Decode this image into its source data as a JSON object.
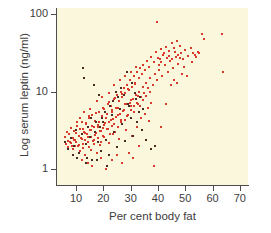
{
  "chart_data": {
    "type": "scatter",
    "title": "",
    "xlabel": "Per cent body fat",
    "ylabel": "Log serum leptin (ng/ml)",
    "xlim": [
      3,
      73
    ],
    "ylim": [
      0.62,
      120
    ],
    "yscale": "log",
    "xscale": "linear",
    "grid": false,
    "legend": null,
    "xticks": [
      10,
      20,
      30,
      40,
      50,
      60,
      70
    ],
    "xtick_labels": [
      "10",
      "20",
      "30",
      "40",
      "50",
      "60",
      "70"
    ],
    "yticks": [
      1,
      10,
      100
    ],
    "ytick_labels": [
      "1",
      "10",
      "100"
    ],
    "panel_background": "#fbf7dc",
    "axis_color": "#4c4c4c",
    "series": [
      {
        "name": "primary",
        "marker_color": "#d83a2e",
        "points": [
          [
            5.8,
            2.6
          ],
          [
            6.2,
            2.1
          ],
          [
            6.5,
            3.0
          ],
          [
            6.9,
            2.3
          ],
          [
            7.2,
            1.9
          ],
          [
            7.5,
            2.8
          ],
          [
            7.8,
            2.2
          ],
          [
            8.1,
            3.4
          ],
          [
            8.4,
            2.0
          ],
          [
            8.7,
            2.5
          ],
          [
            9.0,
            1.8
          ],
          [
            9.2,
            3.1
          ],
          [
            9.5,
            2.4
          ],
          [
            9.8,
            2.9
          ],
          [
            10.1,
            2.2
          ],
          [
            10.4,
            3.6
          ],
          [
            10.7,
            2.0
          ],
          [
            11.0,
            2.7
          ],
          [
            11.3,
            1.7
          ],
          [
            11.6,
            3.3
          ],
          [
            11.9,
            2.5
          ],
          [
            12.2,
            4.0
          ],
          [
            12.5,
            2.1
          ],
          [
            12.8,
            3.0
          ],
          [
            13.1,
            2.4
          ],
          [
            13.4,
            1.5
          ],
          [
            13.7,
            3.8
          ],
          [
            14.0,
            2.8
          ],
          [
            14.3,
            2.2
          ],
          [
            14.6,
            4.5
          ],
          [
            14.9,
            1.9
          ],
          [
            15.2,
            3.2
          ],
          [
            15.5,
            2.6
          ],
          [
            15.8,
            5.0
          ],
          [
            16.1,
            2.3
          ],
          [
            16.4,
            3.5
          ],
          [
            16.7,
            2.1
          ],
          [
            17.0,
            4.2
          ],
          [
            17.3,
            2.9
          ],
          [
            17.6,
            1.6
          ],
          [
            17.9,
            3.7
          ],
          [
            18.2,
            2.5
          ],
          [
            18.5,
            5.5
          ],
          [
            18.8,
            3.1
          ],
          [
            19.1,
            2.2
          ],
          [
            19.4,
            4.8
          ],
          [
            19.7,
            3.4
          ],
          [
            20.0,
            2.7
          ],
          [
            20.3,
            6.0
          ],
          [
            20.6,
            3.9
          ],
          [
            20.9,
            2.4
          ],
          [
            21.2,
            5.2
          ],
          [
            21.5,
            3.3
          ],
          [
            21.8,
            7.0
          ],
          [
            22.1,
            4.1
          ],
          [
            22.4,
            2.8
          ],
          [
            22.7,
            6.5
          ],
          [
            23.0,
            3.6
          ],
          [
            23.3,
            5.8
          ],
          [
            23.6,
            4.4
          ],
          [
            23.9,
            8.0
          ],
          [
            24.2,
            3.0
          ],
          [
            24.5,
            6.2
          ],
          [
            24.8,
            4.7
          ],
          [
            25.1,
            9.0
          ],
          [
            25.4,
            3.5
          ],
          [
            25.7,
            7.5
          ],
          [
            26.0,
            5.1
          ],
          [
            26.3,
            10.0
          ],
          [
            26.6,
            4.0
          ],
          [
            26.9,
            8.5
          ],
          [
            27.2,
            5.6
          ],
          [
            27.5,
            11.0
          ],
          [
            27.8,
            4.3
          ],
          [
            28.1,
            9.5
          ],
          [
            28.4,
            6.8
          ],
          [
            28.7,
            12.0
          ],
          [
            29.0,
            5.0
          ],
          [
            29.3,
            10.5
          ],
          [
            29.6,
            7.2
          ],
          [
            29.9,
            14.0
          ],
          [
            30.2,
            5.8
          ],
          [
            30.5,
            11.5
          ],
          [
            30.8,
            8.0
          ],
          [
            31.1,
            16.0
          ],
          [
            31.4,
            6.5
          ],
          [
            31.7,
            13.0
          ],
          [
            32.0,
            9.0
          ],
          [
            32.3,
            18.0
          ],
          [
            32.6,
            7.0
          ],
          [
            32.9,
            15.0
          ],
          [
            33.2,
            10.0
          ],
          [
            33.5,
            20.0
          ],
          [
            33.8,
            8.5
          ],
          [
            34.1,
            17.0
          ],
          [
            34.4,
            11.5
          ],
          [
            34.7,
            22.0
          ],
          [
            35.0,
            9.5
          ],
          [
            35.3,
            19.0
          ],
          [
            35.6,
            13.0
          ],
          [
            36.0,
            25.0
          ],
          [
            36.4,
            11.0
          ],
          [
            36.8,
            21.0
          ],
          [
            37.2,
            15.0
          ],
          [
            37.6,
            28.0
          ],
          [
            38.0,
            12.0
          ],
          [
            38.4,
            24.0
          ],
          [
            38.8,
            17.0
          ],
          [
            39.2,
            32.0
          ],
          [
            39.6,
            14.0
          ],
          [
            40.0,
            27.0
          ],
          [
            40.5,
            19.0
          ],
          [
            41.0,
            35.0
          ],
          [
            41.5,
            16.0
          ],
          [
            42.0,
            30.0
          ],
          [
            42.5,
            22.0
          ],
          [
            43.0,
            38.0
          ],
          [
            43.5,
            18.0
          ],
          [
            44.0,
            33.0
          ],
          [
            44.5,
            25.0
          ],
          [
            45.0,
            42.0
          ],
          [
            45.5,
            20.0
          ],
          [
            46.0,
            36.0
          ],
          [
            46.5,
            28.0
          ],
          [
            47.0,
            45.0
          ],
          [
            47.5,
            23.0
          ],
          [
            48.0,
            39.0
          ],
          [
            48.5,
            31.0
          ],
          [
            49.0,
            26.0
          ],
          [
            50.0,
            34.0
          ],
          [
            51.0,
            29.0
          ],
          [
            52.0,
            37.0
          ],
          [
            53.0,
            31.0
          ],
          [
            54.0,
            28.0
          ],
          [
            56.0,
            55.0
          ],
          [
            57.0,
            48.0
          ],
          [
            63.5,
            55.0
          ],
          [
            64.0,
            18.0
          ],
          [
            12.0,
            1.3
          ],
          [
            14.5,
            1.2
          ],
          [
            16.0,
            1.1
          ],
          [
            19.0,
            1.4
          ],
          [
            21.0,
            1.0
          ],
          [
            23.0,
            1.3
          ],
          [
            25.0,
            1.5
          ],
          [
            27.0,
            1.2
          ],
          [
            29.5,
            1.6
          ],
          [
            31.0,
            1.4
          ],
          [
            38.5,
            1.1
          ],
          [
            39.5,
            80.0
          ],
          [
            41.0,
            3.5
          ],
          [
            43.0,
            7.0
          ],
          [
            33.0,
            2.0
          ],
          [
            13.0,
            5.5
          ],
          [
            15.0,
            6.0
          ],
          [
            17.5,
            7.5
          ],
          [
            19.5,
            8.5
          ],
          [
            22.0,
            9.5
          ],
          [
            24.0,
            12.0
          ],
          [
            26.0,
            14.0
          ],
          [
            28.0,
            16.0
          ],
          [
            30.0,
            18.0
          ],
          [
            32.0,
            21.0
          ],
          [
            10.5,
            4.0
          ],
          [
            11.5,
            4.5
          ],
          [
            12.5,
            3.3
          ],
          [
            13.5,
            3.9
          ],
          [
            14.8,
            4.8
          ],
          [
            15.9,
            3.6
          ],
          [
            17.2,
            5.3
          ],
          [
            18.4,
            4.1
          ],
          [
            19.8,
            6.2
          ],
          [
            20.8,
            4.6
          ],
          [
            21.9,
            7.3
          ],
          [
            23.1,
            5.4
          ],
          [
            24.3,
            8.2
          ],
          [
            25.5,
            6.1
          ],
          [
            26.7,
            9.2
          ],
          [
            27.9,
            6.9
          ],
          [
            29.1,
            10.8
          ],
          [
            30.3,
            7.8
          ],
          [
            31.5,
            12.4
          ],
          [
            32.7,
            8.8
          ],
          [
            9.4,
            2.35
          ],
          [
            10.9,
            2.65
          ],
          [
            12.1,
            2.45
          ],
          [
            13.3,
            2.95
          ],
          [
            14.4,
            2.55
          ],
          [
            15.6,
            3.15
          ],
          [
            16.8,
            2.75
          ],
          [
            18.0,
            3.45
          ],
          [
            19.2,
            3.05
          ],
          [
            20.4,
            3.75
          ],
          [
            21.6,
            3.25
          ],
          [
            22.8,
            4.35
          ],
          [
            24.0,
            3.85
          ],
          [
            25.2,
            4.95
          ],
          [
            26.4,
            4.25
          ],
          [
            27.6,
            5.75
          ],
          [
            28.8,
            4.85
          ],
          [
            30.0,
            6.45
          ],
          [
            31.2,
            5.45
          ],
          [
            32.4,
            7.15
          ],
          [
            8.2,
            2.15
          ],
          [
            9.6,
            1.95
          ],
          [
            11.2,
            2.05
          ],
          [
            12.6,
            1.85
          ],
          [
            14.2,
            2.25
          ],
          [
            15.4,
            1.75
          ],
          [
            16.6,
            2.35
          ],
          [
            18.6,
            2.05
          ],
          [
            20.2,
            2.55
          ],
          [
            22.2,
            2.15
          ],
          [
            23.5,
            2.85
          ],
          [
            25.8,
            2.45
          ],
          [
            28.2,
            3.15
          ],
          [
            30.6,
            2.65
          ],
          [
            32.2,
            3.45
          ],
          [
            33.4,
            6.5
          ],
          [
            33.8,
            4.5
          ],
          [
            34.2,
            3.2
          ],
          [
            34.6,
            7.8
          ],
          [
            35.2,
            5.2
          ],
          [
            35.8,
            8.8
          ],
          [
            36.2,
            6.2
          ],
          [
            36.6,
            4.2
          ],
          [
            37.0,
            9.8
          ],
          [
            37.4,
            7.2
          ],
          [
            40.2,
            22.0
          ],
          [
            40.8,
            26.0
          ],
          [
            41.2,
            24.0
          ],
          [
            42.2,
            31.0
          ],
          [
            43.2,
            27.0
          ],
          [
            44.2,
            29.0
          ],
          [
            45.2,
            26.0
          ],
          [
            46.2,
            32.0
          ],
          [
            47.2,
            30.0
          ],
          [
            48.2,
            27.0
          ],
          [
            44.8,
            12.0
          ],
          [
            45.8,
            14.0
          ],
          [
            46.8,
            13.0
          ],
          [
            48.8,
            17.0
          ],
          [
            50.5,
            16.0
          ],
          [
            52.5,
            24.0
          ],
          [
            53.5,
            30.0
          ],
          [
            55.0,
            31.0
          ],
          [
            54.5,
            32.0
          ],
          [
            49.5,
            21.0
          ]
        ]
      },
      {
        "name": "secondary",
        "marker_color": "#4a2b24",
        "points": [
          [
            6.0,
            2.2
          ],
          [
            7.0,
            1.8
          ],
          [
            8.0,
            2.5
          ],
          [
            9.3,
            2.0
          ],
          [
            10.0,
            3.2
          ],
          [
            11.0,
            1.6
          ],
          [
            12.0,
            2.8
          ],
          [
            13.0,
            15.0
          ],
          [
            13.5,
            2.1
          ],
          [
            14.0,
            1.4
          ],
          [
            15.0,
            2.6
          ],
          [
            16.0,
            1.3
          ],
          [
            17.0,
            3.0
          ],
          [
            18.0,
            2.2
          ],
          [
            19.0,
            1.7
          ],
          [
            20.0,
            4.0
          ],
          [
            21.0,
            2.4
          ],
          [
            22.0,
            1.5
          ],
          [
            23.0,
            5.0
          ],
          [
            24.0,
            3.0
          ],
          [
            25.0,
            1.9
          ],
          [
            26.0,
            6.0
          ],
          [
            27.0,
            3.8
          ],
          [
            28.0,
            2.3
          ],
          [
            29.0,
            7.0
          ],
          [
            30.0,
            4.5
          ],
          [
            31.0,
            2.7
          ],
          [
            32.0,
            8.0
          ],
          [
            33.0,
            5.5
          ],
          [
            34.0,
            3.2
          ],
          [
            12.5,
            20.0
          ],
          [
            16.5,
            12.0
          ],
          [
            18.5,
            9.0
          ],
          [
            24.5,
            10.0
          ],
          [
            26.5,
            11.0
          ],
          [
            28.5,
            18.0
          ],
          [
            30.5,
            13.0
          ],
          [
            35.5,
            2.4
          ],
          [
            37.5,
            1.8
          ],
          [
            39.0,
            2.0
          ],
          [
            9.0,
            1.5
          ],
          [
            10.5,
            1.4
          ],
          [
            13.8,
            1.2
          ],
          [
            17.8,
            1.3
          ],
          [
            21.5,
            1.1
          ],
          [
            33.5,
            8.5
          ],
          [
            34.5,
            6.0
          ],
          [
            32.5,
            4.0
          ],
          [
            31.5,
            9.5
          ],
          [
            29.5,
            6.5
          ],
          [
            23.5,
            7.5
          ],
          [
            25.5,
            8.5
          ],
          [
            27.5,
            9.0
          ],
          [
            22.5,
            6.5
          ],
          [
            20.5,
            5.5
          ],
          [
            19.5,
            4.5
          ],
          [
            18.8,
            3.5
          ],
          [
            17.2,
            4.0
          ],
          [
            15.5,
            4.5
          ],
          [
            14.2,
            3.5
          ]
        ]
      }
    ]
  }
}
